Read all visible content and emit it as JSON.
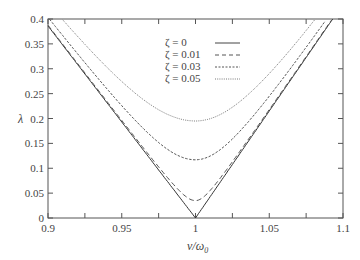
{
  "chart_data": {
    "type": "line",
    "title": "",
    "xlabel": "ν/ω₀",
    "ylabel": "λ",
    "xlim": [
      0.9,
      1.1
    ],
    "ylim": [
      0,
      0.4
    ],
    "xticks": [
      "0.9",
      "0.95",
      "1",
      "1.05",
      "1.1"
    ],
    "yticks": [
      "0",
      "0.05",
      "0.1",
      "0.15",
      "0.2",
      "0.25",
      "0.3",
      "0.35",
      "0.4"
    ],
    "grid": false,
    "legend_position": "upper center",
    "series": [
      {
        "name": "ζ = 0",
        "style": "solid",
        "min_at": 1.0,
        "min_value": 0.0,
        "left_edge_value": 0.385,
        "reaches_0.4_at": 1.093
      },
      {
        "name": "ζ = 0.01",
        "style": "dashed",
        "min_at": 1.0,
        "min_value": 0.035,
        "left_edge_value": 0.39,
        "reaches_0.4_at": 1.092
      },
      {
        "name": "ζ = 0.03",
        "style": "short-dashed",
        "min_at": 1.0,
        "min_value": 0.117,
        "reaches_0.4_at_left": 0.91,
        "reaches_0.4_at": 1.085
      },
      {
        "name": "ζ = 0.05",
        "style": "dotted",
        "min_at": 1.0,
        "min_value": 0.195,
        "reaches_0.4_at_left": 0.915,
        "reaches_0.4_at": 1.07
      }
    ]
  },
  "axes": {
    "xlabel_main": "ν/ω",
    "xlabel_sub": "0",
    "ylabel": "λ",
    "xticks": [
      "0.9",
      "0.95",
      "1",
      "1.05",
      "1.1"
    ],
    "yticks": [
      "0",
      "0.05",
      "0.1",
      "0.15",
      "0.2",
      "0.25",
      "0.3",
      "0.35",
      "0.4"
    ]
  },
  "legend": [
    {
      "label": "ζ = 0"
    },
    {
      "label": "ζ = 0.01"
    },
    {
      "label": "ζ = 0.03"
    },
    {
      "label": "ζ = 0.05"
    }
  ]
}
